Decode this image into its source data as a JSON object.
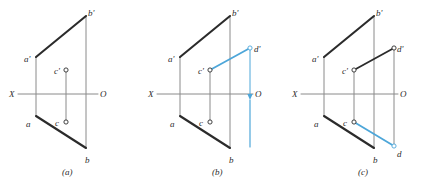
{
  "figure": {
    "background_color": "#ffffff",
    "ink_color": "#2b2b2b",
    "thin_line_color": "#8a8a8a",
    "accent_color": "#4da6d9",
    "width": 427,
    "height": 189
  },
  "panels": [
    {
      "id": "a",
      "caption": "(a)",
      "caption_x": 62,
      "caption_y": 168,
      "ground_line": {
        "x1": 18,
        "y1": 94,
        "x2": 98,
        "y2": 94
      },
      "axis_labels": [
        {
          "text": "X",
          "x": 9,
          "y": 90,
          "name": "x-axis-label"
        },
        {
          "text": "O",
          "x": 100,
          "y": 90,
          "name": "o-axis-label"
        }
      ],
      "bold_segments": [
        {
          "name": "segment-a-prime-b-prime",
          "x1": 36,
          "y1": 57,
          "x2": 86,
          "y2": 16,
          "color": "#2b2b2b",
          "width": 2.1
        },
        {
          "name": "segment-a-b",
          "x1": 36,
          "y1": 116,
          "x2": 86,
          "y2": 148,
          "color": "#2b2b2b",
          "width": 2.1
        }
      ],
      "thin_segments": [
        {
          "name": "projector-a",
          "x1": 36,
          "y1": 57,
          "x2": 36,
          "y2": 116,
          "color": "#8a8a8a",
          "width": 1
        },
        {
          "name": "projector-b",
          "x1": 86,
          "y1": 16,
          "x2": 86,
          "y2": 148,
          "color": "#8a8a8a",
          "width": 1
        },
        {
          "name": "projector-c",
          "x1": 66,
          "y1": 70,
          "x2": 66,
          "y2": 122,
          "color": "#8a8a8a",
          "width": 1
        }
      ],
      "points": [
        {
          "label": "b'",
          "name": "point-b-prime",
          "cx": 86,
          "cy": 16,
          "lx": 88,
          "ly": 9,
          "marker": false
        },
        {
          "label": "a'",
          "name": "point-a-prime",
          "cx": 36,
          "cy": 57,
          "lx": 24,
          "ly": 55,
          "marker": false
        },
        {
          "label": "c'",
          "name": "point-c-prime",
          "cx": 66,
          "cy": 70,
          "lx": 54,
          "ly": 67,
          "marker": true
        },
        {
          "label": "c",
          "name": "point-c",
          "cx": 66,
          "cy": 122,
          "lx": 55,
          "ly": 119,
          "marker": true
        },
        {
          "label": "a",
          "name": "point-a",
          "cx": 36,
          "cy": 116,
          "lx": 26,
          "ly": 120,
          "marker": false
        },
        {
          "label": "b",
          "name": "point-b",
          "cx": 86,
          "cy": 148,
          "lx": 85,
          "ly": 156,
          "marker": false
        }
      ],
      "accent_segments": [],
      "arrow": null
    },
    {
      "id": "b",
      "caption": "(b)",
      "caption_x": 212,
      "caption_y": 168,
      "ground_line": {
        "x1": 157,
        "y1": 94,
        "x2": 253,
        "y2": 94
      },
      "axis_labels": [
        {
          "text": "X",
          "x": 148,
          "y": 90,
          "name": "x-axis-label"
        },
        {
          "text": "O",
          "x": 255,
          "y": 90,
          "name": "o-axis-label"
        }
      ],
      "bold_segments": [
        {
          "name": "segment-a-prime-b-prime",
          "x1": 180,
          "y1": 57,
          "x2": 230,
          "y2": 16,
          "color": "#2b2b2b",
          "width": 2.1
        },
        {
          "name": "segment-a-b",
          "x1": 180,
          "y1": 116,
          "x2": 230,
          "y2": 148,
          "color": "#2b2b2b",
          "width": 2.1
        }
      ],
      "thin_segments": [
        {
          "name": "projector-a",
          "x1": 180,
          "y1": 57,
          "x2": 180,
          "y2": 116,
          "color": "#8a8a8a",
          "width": 1
        },
        {
          "name": "projector-b",
          "x1": 230,
          "y1": 16,
          "x2": 230,
          "y2": 148,
          "color": "#8a8a8a",
          "width": 1
        },
        {
          "name": "projector-c",
          "x1": 210,
          "y1": 70,
          "x2": 210,
          "y2": 122,
          "color": "#8a8a8a",
          "width": 1
        }
      ],
      "points": [
        {
          "label": "b'",
          "name": "point-b-prime",
          "cx": 230,
          "cy": 16,
          "lx": 232,
          "ly": 9,
          "marker": false
        },
        {
          "label": "a'",
          "name": "point-a-prime",
          "cx": 180,
          "cy": 57,
          "lx": 168,
          "ly": 55,
          "marker": false
        },
        {
          "label": "c'",
          "name": "point-c-prime",
          "cx": 210,
          "cy": 70,
          "lx": 198,
          "ly": 67,
          "marker": true
        },
        {
          "label": "c",
          "name": "point-c",
          "cx": 210,
          "cy": 122,
          "lx": 199,
          "ly": 119,
          "marker": true
        },
        {
          "label": "a",
          "name": "point-a",
          "cx": 180,
          "cy": 116,
          "lx": 170,
          "ly": 120,
          "marker": false
        },
        {
          "label": "b",
          "name": "point-b",
          "cx": 230,
          "cy": 148,
          "lx": 229,
          "ly": 156,
          "marker": false
        },
        {
          "label": "d'",
          "name": "point-d-prime",
          "cx": 250,
          "cy": 48,
          "lx": 254,
          "ly": 45,
          "marker": true,
          "color": "#4da6d9"
        }
      ],
      "accent_segments": [
        {
          "name": "segment-c-prime-d-prime",
          "x1": 210,
          "y1": 70,
          "x2": 250,
          "y2": 48,
          "color": "#4da6d9",
          "width": 1.8
        },
        {
          "name": "projector-d-prime",
          "x1": 250,
          "y1": 48,
          "x2": 250,
          "y2": 94,
          "color": "#4da6d9",
          "width": 1
        }
      ],
      "arrow": {
        "name": "upward-construction-arrow",
        "x": 250,
        "y_tail": 147,
        "y_head": 100,
        "color": "#4da6d9",
        "direction": "up"
      }
    },
    {
      "id": "c",
      "caption": "(c)",
      "caption_x": 358,
      "caption_y": 168,
      "ground_line": {
        "x1": 301,
        "y1": 94,
        "x2": 398,
        "y2": 94
      },
      "axis_labels": [
        {
          "text": "X",
          "x": 292,
          "y": 90,
          "name": "x-axis-label"
        },
        {
          "text": "O",
          "x": 400,
          "y": 90,
          "name": "o-axis-label"
        }
      ],
      "bold_segments": [
        {
          "name": "segment-a-prime-b-prime",
          "x1": 324,
          "y1": 57,
          "x2": 374,
          "y2": 16,
          "color": "#2b2b2b",
          "width": 2.1
        },
        {
          "name": "segment-a-b",
          "x1": 324,
          "y1": 116,
          "x2": 374,
          "y2": 148,
          "color": "#2b2b2b",
          "width": 2.1
        },
        {
          "name": "segment-c-prime-d-prime",
          "x1": 354,
          "y1": 70,
          "x2": 394,
          "y2": 48,
          "color": "#2b2b2b",
          "width": 1.8
        }
      ],
      "thin_segments": [
        {
          "name": "projector-a",
          "x1": 324,
          "y1": 57,
          "x2": 324,
          "y2": 116,
          "color": "#8a8a8a",
          "width": 1
        },
        {
          "name": "projector-b",
          "x1": 374,
          "y1": 16,
          "x2": 374,
          "y2": 148,
          "color": "#8a8a8a",
          "width": 1
        },
        {
          "name": "projector-c",
          "x1": 354,
          "y1": 70,
          "x2": 354,
          "y2": 122,
          "color": "#8a8a8a",
          "width": 1
        },
        {
          "name": "projector-d",
          "x1": 394,
          "y1": 48,
          "x2": 394,
          "y2": 146,
          "color": "#8a8a8a",
          "width": 1
        }
      ],
      "points": [
        {
          "label": "b'",
          "name": "point-b-prime",
          "cx": 374,
          "cy": 16,
          "lx": 376,
          "ly": 9,
          "marker": false
        },
        {
          "label": "a'",
          "name": "point-a-prime",
          "cx": 324,
          "cy": 57,
          "lx": 312,
          "ly": 55,
          "marker": false
        },
        {
          "label": "c'",
          "name": "point-c-prime",
          "cx": 354,
          "cy": 70,
          "lx": 342,
          "ly": 67,
          "marker": true
        },
        {
          "label": "d'",
          "name": "point-d-prime",
          "cx": 394,
          "cy": 48,
          "lx": 397,
          "ly": 45,
          "marker": true
        },
        {
          "label": "c",
          "name": "point-c",
          "cx": 354,
          "cy": 122,
          "lx": 343,
          "ly": 119,
          "marker": true
        },
        {
          "label": "a",
          "name": "point-a",
          "cx": 324,
          "cy": 116,
          "lx": 314,
          "ly": 120,
          "marker": false
        },
        {
          "label": "b",
          "name": "point-b",
          "cx": 374,
          "cy": 148,
          "lx": 373,
          "ly": 156,
          "marker": false
        },
        {
          "label": "d",
          "name": "point-d",
          "cx": 394,
          "cy": 146,
          "lx": 397,
          "ly": 150,
          "marker": true,
          "color": "#4da6d9"
        }
      ],
      "accent_segments": [
        {
          "name": "segment-c-d",
          "x1": 354,
          "y1": 122,
          "x2": 394,
          "y2": 146,
          "color": "#4da6d9",
          "width": 1.8
        }
      ],
      "arrow": null
    }
  ]
}
